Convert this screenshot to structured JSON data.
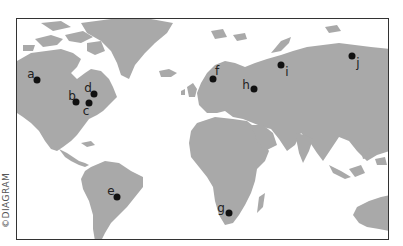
{
  "map": {
    "credit": "©DIAGRAM",
    "land_color": "#a9a9a9",
    "border_color": "#333333",
    "markers": [
      {
        "id": "a",
        "label": "a",
        "dot": [
          36,
          79
        ],
        "label_pos": [
          30,
          73
        ]
      },
      {
        "id": "b",
        "label": "b",
        "dot": [
          75,
          101
        ],
        "label_pos": [
          71,
          95
        ]
      },
      {
        "id": "c",
        "label": "c",
        "dot": [
          88,
          102
        ],
        "label_pos": [
          85,
          110
        ]
      },
      {
        "id": "d",
        "label": "d",
        "dot": [
          93,
          93
        ],
        "label_pos": [
          87,
          87
        ]
      },
      {
        "id": "e",
        "label": "e",
        "dot": [
          116,
          196
        ],
        "label_pos": [
          110,
          190
        ]
      },
      {
        "id": "f",
        "label": "f",
        "dot": [
          212,
          78
        ],
        "label_pos": [
          216,
          70
        ]
      },
      {
        "id": "g",
        "label": "g",
        "dot": [
          228,
          212
        ],
        "label_pos": [
          220,
          207
        ]
      },
      {
        "id": "h",
        "label": "h",
        "dot": [
          253,
          88
        ],
        "label_pos": [
          245,
          84
        ]
      },
      {
        "id": "i",
        "label": "i",
        "dot": [
          280,
          64
        ],
        "label_pos": [
          286,
          71
        ]
      },
      {
        "id": "j",
        "label": "j",
        "dot": [
          351,
          55
        ],
        "label_pos": [
          357,
          62
        ]
      }
    ]
  }
}
